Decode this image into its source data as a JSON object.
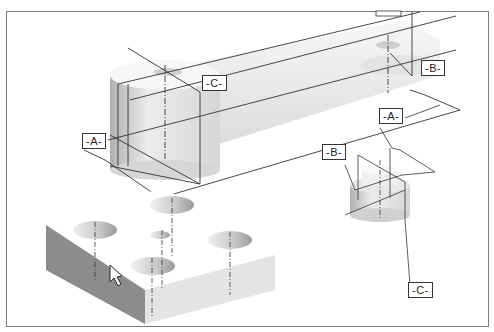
{
  "figure": {
    "type": "CAD datum reference frame illustration",
    "datum_labels": {
      "large_part": {
        "a": "-A-",
        "b": "-B-",
        "c": "-C-"
      },
      "small_part": {
        "a": "-A-",
        "b": "-B-",
        "c": "-C-"
      }
    },
    "parts": [
      "connecting-link",
      "small-stepped-cylinder",
      "plate-with-holes"
    ],
    "colors": {
      "frame_border": "#7a7a7a",
      "line": "#333333",
      "shade_dark": "#8c8c8c",
      "shade_light": "#e6e6e6"
    }
  }
}
